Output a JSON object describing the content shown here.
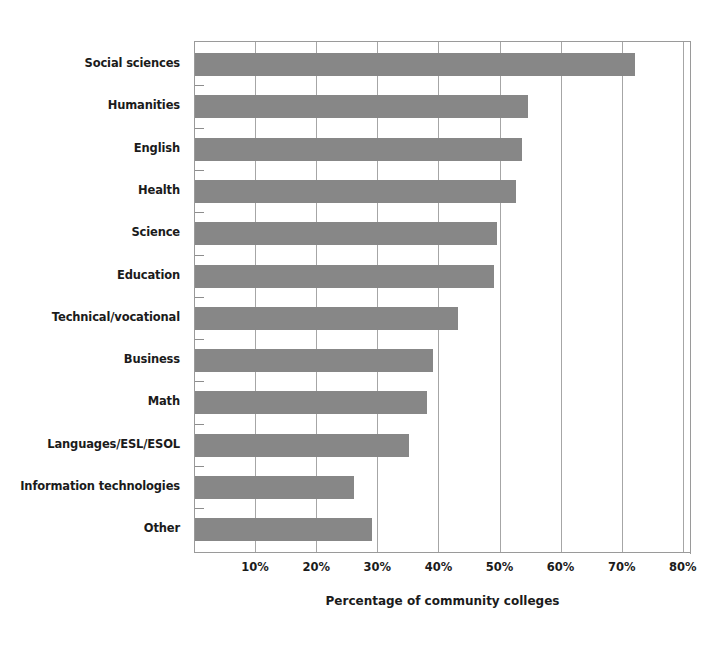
{
  "chart_data": {
    "type": "bar",
    "orientation": "horizontal",
    "title": "",
    "xlabel": "Percentage of community colleges",
    "ylabel": "",
    "xlim": [
      0,
      85
    ],
    "xticks": [
      10,
      20,
      30,
      40,
      50,
      60,
      70,
      80
    ],
    "xtick_labels": [
      "10%",
      "20%",
      "30%",
      "40%",
      "50%",
      "60%",
      "70%",
      "80%"
    ],
    "grid": "vertical",
    "legend": "none",
    "bar_color": "#878787",
    "axis_color": "#9a9a9a",
    "categories": [
      "Social sciences",
      "Humanities",
      "English",
      "Health",
      "Science",
      "Education",
      "Technical/vocational",
      "Business",
      "Math",
      "Languages/ESL/ESOL",
      "Information technologies",
      "Other"
    ],
    "values": [
      72,
      54.5,
      53.5,
      52.5,
      49.5,
      49,
      43,
      39,
      38,
      35,
      26,
      29
    ],
    "value_labels": [
      "72%",
      "54.5%",
      "53.5%",
      "52.5%",
      "49.5%",
      "49%",
      "43%",
      "39%",
      "38%",
      "35%",
      "26%",
      "29%"
    ],
    "series": [
      {
        "name": "Percentage of community colleges",
        "values": [
          72,
          54.5,
          53.5,
          52.5,
          49.5,
          49,
          43,
          39,
          38,
          35,
          26,
          29
        ]
      }
    ]
  }
}
